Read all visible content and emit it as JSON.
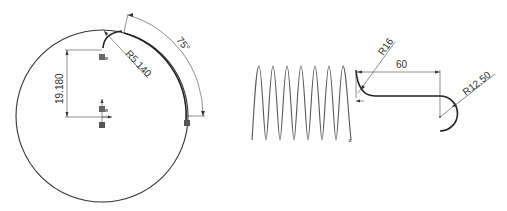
{
  "left_sketch": {
    "title": "Circle sketch with arc",
    "dimensions": {
      "vertical": "19.180",
      "radius": "R5.140",
      "angle": "75°"
    },
    "circle": {
      "cx": 102,
      "cy": 116,
      "r": 86
    },
    "relation_badges": [
      "coincident-relation",
      "coincident-relation",
      "fixed-relation",
      "fixed-relation"
    ]
  },
  "right_sketch": {
    "title": "Spring sweep profile",
    "dimensions": {
      "radius_small": "R16",
      "length": "60",
      "radius_end": "R12.50"
    },
    "spring": {
      "turns": 7,
      "x_start": 252,
      "x_end": 352,
      "y_top": 66,
      "y_bottom": 140
    }
  }
}
